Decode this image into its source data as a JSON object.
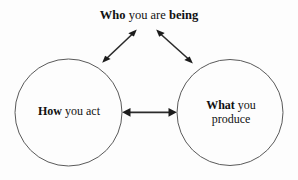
{
  "diagram": {
    "type": "triangle-relationship-diagram",
    "background_color": "#fdfdfd",
    "stroke_color": "#2b2b2b",
    "circle_stroke_color": "#5a5a5a",
    "text_color": "#111111",
    "nodes": [
      {
        "id": "being",
        "shape": "text-only",
        "position": "top-center",
        "text_parts": [
          {
            "text": "Who",
            "emphasis": "bold"
          },
          {
            "text": "you are",
            "emphasis": "regular"
          },
          {
            "text": "being",
            "emphasis": "bold"
          }
        ]
      },
      {
        "id": "act",
        "shape": "circle",
        "position": "bottom-left",
        "lines": [
          [
            {
              "text": "How",
              "emphasis": "bold"
            },
            {
              "text": "you act",
              "emphasis": "regular"
            }
          ]
        ]
      },
      {
        "id": "produce",
        "shape": "circle",
        "position": "bottom-right",
        "lines": [
          [
            {
              "text": "What",
              "emphasis": "bold"
            },
            {
              "text": "you",
              "emphasis": "regular"
            }
          ],
          [
            {
              "text": "produce",
              "emphasis": "regular"
            }
          ]
        ]
      }
    ],
    "connectors": [
      {
        "id": "being-act",
        "from": "being",
        "to": "act",
        "style": "double-headed-arrow",
        "orientation": "diagonal-left"
      },
      {
        "id": "being-produce",
        "from": "being",
        "to": "produce",
        "style": "double-headed-arrow",
        "orientation": "diagonal-right"
      },
      {
        "id": "act-produce",
        "from": "act",
        "to": "produce",
        "style": "double-headed-arrow",
        "orientation": "horizontal"
      }
    ]
  }
}
